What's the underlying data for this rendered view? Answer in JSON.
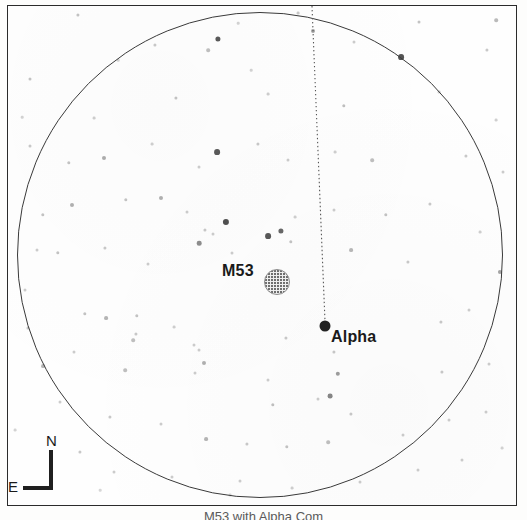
{
  "figure": {
    "kind": "telescope-eyepiece-star-chart",
    "caption": "M53 with Alpha Com",
    "background_color": "#fdfdfc",
    "frame_color": "#2b2b2b",
    "circle_color": "#3a3a3a"
  },
  "field_of_view": {
    "label": "eyepiece-field-circle",
    "center_x": 260,
    "center_y": 255,
    "radius": 243
  },
  "objects": [
    {
      "id": "m53",
      "label": "M53",
      "type": "globular-cluster",
      "symbol": "stippled-disc",
      "x": 277,
      "y": 282,
      "symbol_radius": 13,
      "label_x": 222,
      "label_y": 262,
      "color": "#6f6f6f"
    },
    {
      "id": "alpha",
      "label": "Alpha",
      "type": "star",
      "symbol": "filled-dot",
      "x": 325,
      "y": 326,
      "symbol_radius": 5.5,
      "label_x": 331,
      "label_y": 328,
      "color": "#232323"
    }
  ],
  "guide_line": {
    "name": "alpha-pointer-line",
    "style": "dotted",
    "color": "#555555",
    "x1": 312,
    "y1": 6,
    "x2": 325,
    "y2": 321
  },
  "compass": {
    "north_label": "N",
    "east_label": "E",
    "orientation": "north-up-east-left",
    "color": "#1f1f1f"
  },
  "chart_data": {
    "type": "scatter",
    "title": "M53 with Alpha Com",
    "xlabel": "",
    "ylabel": "",
    "xlim": [
      0,
      527
    ],
    "ylim": [
      0,
      520
    ],
    "grid": false,
    "legend": null,
    "annotations": [
      "M53",
      "Alpha",
      "N",
      "E"
    ],
    "series": [
      {
        "name": "field-stars",
        "marker": "dot",
        "color": "#3c3c3c",
        "points": [
          [
            78,
            15,
            1.6,
            0.3
          ],
          [
            298,
            13,
            1.4,
            0.28
          ],
          [
            419,
            22,
            1.5,
            0.3
          ],
          [
            218,
            39,
            2.6,
            0.85
          ],
          [
            496,
            20,
            1.8,
            0.35
          ],
          [
            238,
            23,
            1.3,
            0.22
          ],
          [
            30,
            79,
            1.5,
            0.3
          ],
          [
            155,
            45,
            1.6,
            0.28
          ],
          [
            208,
            50,
            1.8,
            0.32
          ],
          [
            313,
            31,
            2.0,
            0.45
          ],
          [
            401,
            57,
            2.9,
            0.88
          ],
          [
            487,
            50,
            1.6,
            0.28
          ],
          [
            118,
            60,
            1.3,
            0.22
          ],
          [
            354,
            42,
            1.5,
            0.26
          ],
          [
            251,
            70,
            1.3,
            0.22
          ],
          [
            94,
            118,
            1.4,
            0.25
          ],
          [
            176,
            98,
            1.6,
            0.3
          ],
          [
            268,
            94,
            1.4,
            0.25
          ],
          [
            344,
            106,
            1.7,
            0.32
          ],
          [
            439,
            92,
            1.4,
            0.26
          ],
          [
            30,
            146,
            1.5,
            0.28
          ],
          [
            69,
            163,
            1.7,
            0.3
          ],
          [
            104,
            158,
            2.0,
            0.42
          ],
          [
            152,
            144,
            1.4,
            0.24
          ],
          [
            217,
            152,
            2.9,
            0.85
          ],
          [
            199,
            167,
            1.5,
            0.26
          ],
          [
            258,
            144,
            1.6,
            0.28
          ],
          [
            288,
            160,
            1.5,
            0.26
          ],
          [
            335,
            152,
            1.4,
            0.24
          ],
          [
            372,
            160,
            1.8,
            0.32
          ],
          [
            466,
            156,
            1.6,
            0.28
          ],
          [
            503,
            172,
            1.5,
            0.26
          ],
          [
            72,
            205,
            2.0,
            0.4
          ],
          [
            43,
            215,
            1.7,
            0.3
          ],
          [
            126,
            200,
            1.7,
            0.3
          ],
          [
            161,
            198,
            2.0,
            0.4
          ],
          [
            187,
            212,
            1.5,
            0.26
          ],
          [
            205,
            230,
            1.6,
            0.28
          ],
          [
            226,
            222,
            3.1,
            0.9
          ],
          [
            199,
            243,
            2.3,
            0.58
          ],
          [
            213,
            234,
            1.5,
            0.26
          ],
          [
            268,
            236,
            2.9,
            0.86
          ],
          [
            281,
            231,
            2.6,
            0.78
          ],
          [
            291,
            242,
            1.7,
            0.3
          ],
          [
            232,
            253,
            1.5,
            0.26
          ],
          [
            295,
            217,
            1.4,
            0.24
          ],
          [
            334,
            210,
            1.5,
            0.26
          ],
          [
            386,
            215,
            1.7,
            0.3
          ],
          [
            430,
            204,
            1.6,
            0.28
          ],
          [
            480,
            232,
            1.4,
            0.24
          ],
          [
            37,
            250,
            1.5,
            0.26
          ],
          [
            58,
            253,
            1.7,
            0.3
          ],
          [
            105,
            248,
            1.6,
            0.28
          ],
          [
            148,
            264,
            1.5,
            0.26
          ],
          [
            351,
            250,
            1.9,
            0.36
          ],
          [
            408,
            262,
            1.6,
            0.28
          ],
          [
            500,
            272,
            2.1,
            0.46
          ],
          [
            25,
            290,
            1.5,
            0.26
          ],
          [
            85,
            314,
            1.7,
            0.3
          ],
          [
            106,
            318,
            1.9,
            0.38
          ],
          [
            137,
            316,
            1.7,
            0.3
          ],
          [
            174,
            327,
            1.4,
            0.24
          ],
          [
            136,
            334,
            1.6,
            0.28
          ],
          [
            194,
            345,
            1.5,
            0.26
          ],
          [
            133,
            340,
            1.8,
            0.32
          ],
          [
            286,
            338,
            1.6,
            0.28
          ],
          [
            441,
            322,
            1.6,
            0.28
          ],
          [
            469,
            310,
            1.5,
            0.26
          ],
          [
            28,
            328,
            1.6,
            0.28
          ],
          [
            74,
            352,
            1.5,
            0.26
          ],
          [
            43,
            366,
            1.9,
            0.38
          ],
          [
            125,
            370,
            1.8,
            0.32
          ],
          [
            195,
            373,
            1.5,
            0.26
          ],
          [
            199,
            350,
            1.5,
            0.26
          ],
          [
            204,
            363,
            2.0,
            0.4
          ],
          [
            334,
            352,
            1.6,
            0.28
          ],
          [
            338,
            374,
            2.2,
            0.5
          ],
          [
            268,
            380,
            1.5,
            0.26
          ],
          [
            442,
            372,
            1.6,
            0.28
          ],
          [
            489,
            364,
            1.5,
            0.26
          ],
          [
            273,
            405,
            1.7,
            0.32
          ],
          [
            318,
            399,
            1.5,
            0.26
          ],
          [
            330,
            396,
            2.4,
            0.62
          ],
          [
            351,
            414,
            1.6,
            0.28
          ],
          [
            60,
            402,
            1.5,
            0.26
          ],
          [
            110,
            417,
            1.6,
            0.28
          ],
          [
            161,
            424,
            1.5,
            0.26
          ],
          [
            206,
            439,
            1.9,
            0.38
          ],
          [
            247,
            444,
            1.6,
            0.28
          ],
          [
            287,
            447,
            1.7,
            0.3
          ],
          [
            328,
            442,
            1.8,
            0.32
          ],
          [
            403,
            435,
            1.5,
            0.26
          ],
          [
            449,
            420,
            1.5,
            0.26
          ],
          [
            486,
            412,
            1.5,
            0.26
          ],
          [
            80,
            452,
            1.6,
            0.28
          ],
          [
            114,
            472,
            1.5,
            0.26
          ],
          [
            172,
            477,
            1.5,
            0.26
          ],
          [
            240,
            481,
            1.5,
            0.26
          ],
          [
            292,
            488,
            1.4,
            0.24
          ],
          [
            360,
            482,
            1.5,
            0.26
          ],
          [
            418,
            470,
            1.5,
            0.26
          ],
          [
            462,
            460,
            1.5,
            0.26
          ],
          [
            230,
            495,
            1.4,
            0.22
          ],
          [
            100,
            490,
            1.3,
            0.2
          ],
          [
            15,
            430,
            1.4,
            0.22
          ],
          [
            502,
            448,
            1.4,
            0.22
          ],
          [
            496,
            120,
            1.4,
            0.24
          ],
          [
            22,
            117,
            1.3,
            0.22
          ]
        ]
      }
    ]
  }
}
